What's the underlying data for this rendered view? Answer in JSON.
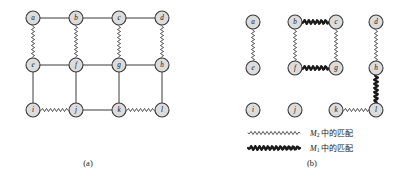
{
  "figure": {
    "title_absent": true,
    "panels": [
      {
        "id": "panel-a",
        "caption": "(a)",
        "nodes": [
          {
            "id": "a",
            "label": "a",
            "x": 33,
            "y": 18
          },
          {
            "id": "b",
            "label": "b",
            "x": 76,
            "y": 18
          },
          {
            "id": "c",
            "label": "c",
            "x": 119,
            "y": 18
          },
          {
            "id": "d",
            "label": "d",
            "x": 162,
            "y": 18
          },
          {
            "id": "e",
            "label": "e",
            "x": 33,
            "y": 65
          },
          {
            "id": "f",
            "label": "f",
            "x": 76,
            "y": 65
          },
          {
            "id": "g",
            "label": "g",
            "x": 119,
            "y": 65
          },
          {
            "id": "h",
            "label": "h",
            "x": 162,
            "y": 65
          },
          {
            "id": "i",
            "label": "i",
            "x": 33,
            "y": 110
          },
          {
            "id": "j",
            "label": "j",
            "x": 76,
            "y": 110
          },
          {
            "id": "k",
            "label": "k",
            "x": 119,
            "y": 110
          },
          {
            "id": "l",
            "label": "l",
            "x": 162,
            "y": 110
          }
        ],
        "edges": [
          {
            "from": "a",
            "to": "b",
            "style": "plain"
          },
          {
            "from": "b",
            "to": "c",
            "style": "plain"
          },
          {
            "from": "c",
            "to": "d",
            "style": "plain"
          },
          {
            "from": "e",
            "to": "f",
            "style": "plain"
          },
          {
            "from": "f",
            "to": "g",
            "style": "plain"
          },
          {
            "from": "g",
            "to": "h",
            "style": "plain"
          },
          {
            "from": "i",
            "to": "j",
            "style": "wavy-thin"
          },
          {
            "from": "j",
            "to": "k",
            "style": "plain"
          },
          {
            "from": "k",
            "to": "l",
            "style": "wavy-thin"
          },
          {
            "from": "a",
            "to": "e",
            "style": "wavy-thin"
          },
          {
            "from": "b",
            "to": "f",
            "style": "wavy-thin"
          },
          {
            "from": "c",
            "to": "g",
            "style": "wavy-thin"
          },
          {
            "from": "d",
            "to": "h",
            "style": "wavy-thin"
          },
          {
            "from": "e",
            "to": "i",
            "style": "plain"
          },
          {
            "from": "f",
            "to": "j",
            "style": "plain"
          },
          {
            "from": "g",
            "to": "k",
            "style": "plain"
          },
          {
            "from": "h",
            "to": "l",
            "style": "plain"
          }
        ]
      },
      {
        "id": "panel-b",
        "caption": "(b)",
        "nodes": [
          {
            "id": "a",
            "label": "a",
            "x": 253,
            "y": 22
          },
          {
            "id": "b",
            "label": "b",
            "x": 295,
            "y": 22
          },
          {
            "id": "c",
            "label": "c",
            "x": 336,
            "y": 22
          },
          {
            "id": "d",
            "label": "d",
            "x": 376,
            "y": 22
          },
          {
            "id": "e",
            "label": "e",
            "x": 253,
            "y": 68
          },
          {
            "id": "f",
            "label": "f",
            "x": 295,
            "y": 68
          },
          {
            "id": "g",
            "label": "g",
            "x": 336,
            "y": 68
          },
          {
            "id": "h",
            "label": "h",
            "x": 376,
            "y": 68
          },
          {
            "id": "i",
            "label": "i",
            "x": 253,
            "y": 110
          },
          {
            "id": "j",
            "label": "j",
            "x": 295,
            "y": 110
          },
          {
            "id": "k",
            "label": "k",
            "x": 336,
            "y": 110
          },
          {
            "id": "l",
            "label": "l",
            "x": 376,
            "y": 110
          }
        ],
        "edges": [
          {
            "from": "a",
            "to": "e",
            "style": "wavy-thin"
          },
          {
            "from": "b",
            "to": "c",
            "style": "wavy-thick"
          },
          {
            "from": "b",
            "to": "f",
            "style": "wavy-thin"
          },
          {
            "from": "c",
            "to": "g",
            "style": "wavy-thin"
          },
          {
            "from": "f",
            "to": "g",
            "style": "wavy-thick"
          },
          {
            "from": "d",
            "to": "h",
            "style": "wavy-thin"
          },
          {
            "from": "h",
            "to": "l",
            "style": "wavy-thick"
          },
          {
            "from": "k",
            "to": "l",
            "style": "wavy-thin"
          }
        ]
      }
    ],
    "legend": {
      "items": [
        {
          "id": "legend-m2",
          "style": "wavy-thin",
          "symbol_prefix": "M",
          "symbol_sub": "2",
          "text_suffix": " 中的匹配",
          "full_text": "M2 中的匹配",
          "sample": {
            "x1": 248,
            "y1": 133,
            "x2": 300,
            "y2": 133
          }
        },
        {
          "id": "legend-m1",
          "style": "wavy-thick",
          "symbol_prefix": "M",
          "symbol_sub": "1",
          "text_suffix": " 中的匹配",
          "full_text": "M1 中的匹配",
          "sample": {
            "x1": 248,
            "y1": 148,
            "x2": 300,
            "y2": 148
          }
        }
      ]
    },
    "captions": [
      {
        "id": "caption-a",
        "text": "(a)",
        "x": 88,
        "y": 166
      },
      {
        "id": "caption-b",
        "text": "(b)",
        "x": 312,
        "y": 166
      }
    ],
    "colors": {
      "node_fill": "#dcdcdc",
      "node_stroke": "#3a3a3a",
      "edge_plain": "#3a3a3a",
      "edge_thick": "#1a1a1a",
      "background": "#ffffff",
      "text": "#111111"
    },
    "geometry": {
      "node_radius": 7.0,
      "wave_amplitude_thin": 1.6,
      "wave_period_thin": 4.0,
      "wave_amplitude_thick": 1.9,
      "wave_period_thick": 4.2
    }
  }
}
